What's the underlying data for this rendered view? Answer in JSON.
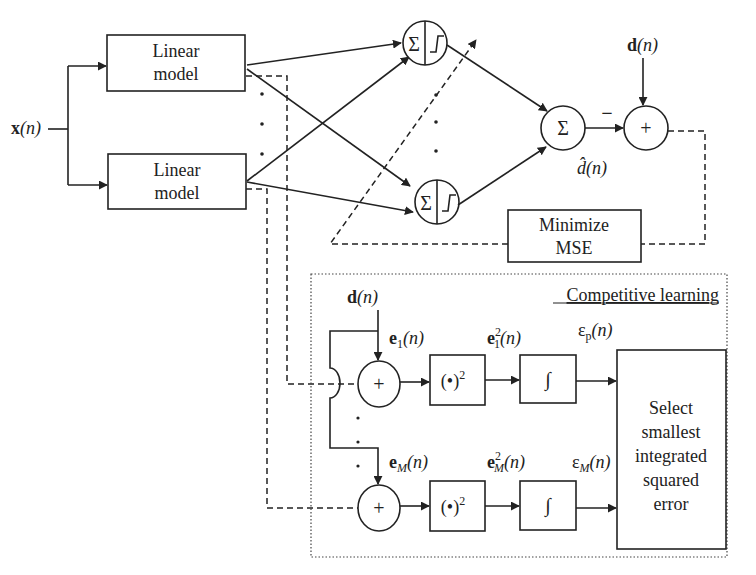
{
  "diagram": {
    "input_label": {
      "bold": "x",
      "rest": "(n)"
    },
    "linear_models": [
      {
        "line1": "Linear",
        "line2": "model"
      },
      {
        "line1": "Linear",
        "line2": "model"
      }
    ],
    "neuron_symbol": "Σ",
    "sum_symbol": "Σ",
    "plus_symbol": "+",
    "minus_symbol": "−",
    "desired_label": {
      "bold": "d",
      "rest": "(n)"
    },
    "estimate_label": {
      "hat": "d̂",
      "rest": "(n)"
    },
    "minimize_box": {
      "line1": "Minimize",
      "line2": "MSE"
    },
    "competitive": {
      "title": "Competitive learning",
      "desired_label": {
        "bold": "d",
        "rest": "(n)"
      },
      "error_labels": [
        {
          "bold": "e",
          "sub": "1",
          "rest": "(n)"
        },
        {
          "bold": "e",
          "sub": "M",
          "rest": "(n)"
        }
      ],
      "squared_labels": [
        {
          "bold": "e",
          "sub": "1",
          "sup": "2",
          "rest": "(n)"
        },
        {
          "bold": "e",
          "sub": "M",
          "sup": "2",
          "rest": "(n)"
        }
      ],
      "integrated_labels": [
        {
          "sym": "ε",
          "sub": "p",
          "rest": "(n)"
        },
        {
          "sym": "ε",
          "sub": "M",
          "rest": "(n)"
        }
      ],
      "square_box": {
        "base": "(•)",
        "sup": "2"
      },
      "integral_symbol": "∫",
      "select_box": [
        "Select",
        "smallest",
        "integrated",
        "squared",
        "error"
      ]
    }
  }
}
